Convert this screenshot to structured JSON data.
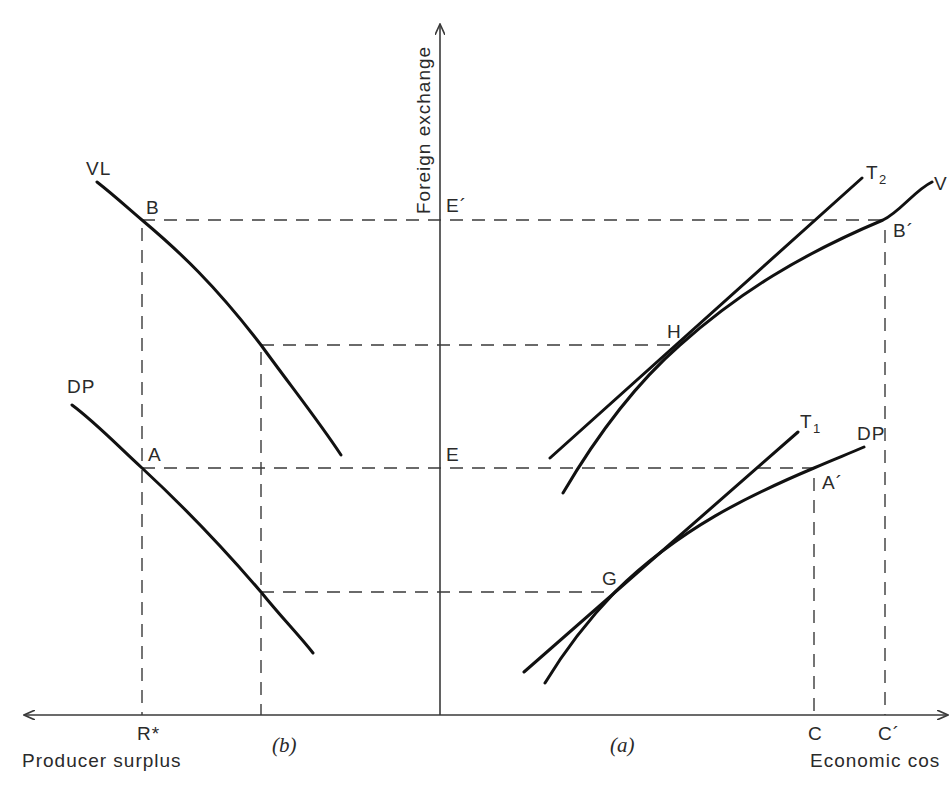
{
  "figure": {
    "axes": {
      "y_label": "Foreign exchange",
      "x_label_left": "Producer surplus",
      "x_label_right": "Economic cos"
    },
    "panels": {
      "left": "(b)",
      "right": "(a)"
    },
    "left_panel": {
      "curve_labels": {
        "upper": "VL",
        "lower": "DP"
      },
      "points": {
        "B": "B",
        "A": "A"
      },
      "x_ticks": {
        "r_star": "R*"
      }
    },
    "axis_points": {
      "e_prime": "E´",
      "e": "E"
    },
    "right_panel": {
      "curve_labels": {
        "upper_curve": "V",
        "upper_tangent_T": "T",
        "upper_tangent_sub": "2",
        "lower_tangent_T": "T",
        "lower_tangent_sub": "1",
        "lower_curve": "DP"
      },
      "points": {
        "H": "H",
        "G": "G",
        "B_prime": "B´",
        "A_prime": "A´"
      },
      "x_ticks": {
        "c": "C",
        "c_prime": "C´"
      }
    },
    "colors": {
      "curve": "#111111",
      "axis": "#3a3a3a",
      "text": "#2a2a2a",
      "background": "#ffffff"
    }
  }
}
